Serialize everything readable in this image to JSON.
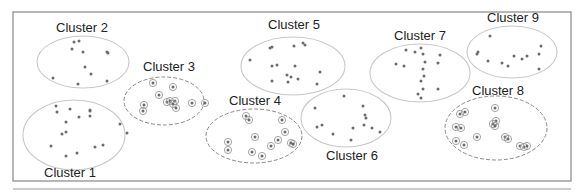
{
  "diagram": {
    "title": "",
    "frame": {
      "x": 13,
      "y": 12,
      "w": 558,
      "h": 169,
      "stroke": "#888888"
    },
    "lower_frame": {
      "x": 13,
      "y": 189,
      "w": 558,
      "stroke": "#999999"
    },
    "colors": {
      "dot": "#6b6b6b",
      "solid_ellipse": "#c8c8c8",
      "dashed_ellipse": "#8a8a8a",
      "ring": "#9a9a9a",
      "label": "#222222"
    },
    "clusters": [
      {
        "id": 1,
        "label": "Cluster 1",
        "style": "solid",
        "cx": 74,
        "cy": 135,
        "rx": 51,
        "ry": 35,
        "label_x": 44,
        "label_y": 177,
        "points": [
          [
            56,
            106
          ],
          [
            70,
            109
          ],
          [
            90,
            110
          ],
          [
            57,
            112
          ],
          [
            90,
            111
          ],
          [
            79,
            117
          ],
          [
            90,
            116
          ],
          [
            66,
            122
          ],
          [
            120,
            124
          ],
          [
            127,
            133
          ],
          [
            62,
            134
          ],
          [
            66,
            132
          ],
          [
            51,
            146
          ],
          [
            95,
            147
          ],
          [
            103,
            145
          ],
          [
            66,
            156
          ],
          [
            77,
            153
          ]
        ]
      },
      {
        "id": 2,
        "label": "Cluster 2",
        "style": "solid",
        "cx": 83,
        "cy": 62,
        "rx": 46,
        "ry": 26,
        "label_x": 56,
        "label_y": 32,
        "points": [
          [
            74,
            42
          ],
          [
            79,
            41
          ],
          [
            72,
            49
          ],
          [
            83,
            52
          ],
          [
            107,
            52
          ],
          [
            108,
            53
          ],
          [
            85,
            67
          ],
          [
            91,
            74
          ],
          [
            53,
            78
          ],
          [
            78,
            84
          ],
          [
            107,
            81
          ]
        ]
      },
      {
        "id": 3,
        "label": "Cluster 3",
        "style": "dashed",
        "cx": 164,
        "cy": 101,
        "rx": 40,
        "ry": 24,
        "label_x": 143,
        "label_y": 71,
        "points": [
          [
            153,
            83
          ],
          [
            173,
            87
          ],
          [
            159,
            95
          ],
          [
            144,
            105
          ],
          [
            167,
            102
          ],
          [
            170,
            101
          ],
          [
            175,
            101
          ],
          [
            173,
            104
          ],
          [
            176,
            108
          ],
          [
            192,
            103
          ],
          [
            205,
            103
          ],
          [
            143,
            111
          ]
        ]
      },
      {
        "id": 4,
        "label": "Cluster 4",
        "style": "dashed",
        "cx": 254,
        "cy": 136,
        "rx": 48,
        "ry": 27,
        "label_x": 229,
        "label_y": 105,
        "points": [
          [
            246,
            116
          ],
          [
            249,
            120
          ],
          [
            282,
            120
          ],
          [
            285,
            132
          ],
          [
            255,
            137
          ],
          [
            278,
            140
          ],
          [
            228,
            142
          ],
          [
            271,
            146
          ],
          [
            291,
            143
          ],
          [
            293,
            144
          ],
          [
            228,
            150
          ],
          [
            252,
            152
          ],
          [
            262,
            156
          ]
        ]
      },
      {
        "id": 5,
        "label": "Cluster 5",
        "style": "solid",
        "cx": 293,
        "cy": 66,
        "rx": 52,
        "ry": 29,
        "label_x": 268,
        "label_y": 29,
        "points": [
          [
            270,
            48
          ],
          [
            272,
            47
          ],
          [
            294,
            46
          ],
          [
            303,
            43
          ],
          [
            305,
            45
          ],
          [
            250,
            60
          ],
          [
            272,
            66
          ],
          [
            277,
            65
          ],
          [
            295,
            66
          ],
          [
            320,
            72
          ],
          [
            287,
            75
          ],
          [
            291,
            77
          ],
          [
            298,
            79
          ],
          [
            272,
            81
          ],
          [
            288,
            82
          ],
          [
            317,
            84
          ]
        ]
      },
      {
        "id": 6,
        "label": "Cluster 6",
        "style": "solid",
        "cx": 346,
        "cy": 118,
        "rx": 45,
        "ry": 29,
        "label_x": 326,
        "label_y": 160,
        "points": [
          [
            344,
            96
          ],
          [
            315,
            108
          ],
          [
            363,
            106
          ],
          [
            365,
            115
          ],
          [
            366,
            118
          ],
          [
            322,
            125
          ],
          [
            317,
            127
          ],
          [
            353,
            128
          ],
          [
            364,
            125
          ],
          [
            372,
            128
          ],
          [
            380,
            132
          ],
          [
            333,
            134
          ],
          [
            351,
            140
          ]
        ]
      },
      {
        "id": 7,
        "label": "Cluster 7",
        "style": "solid",
        "cx": 420,
        "cy": 73,
        "rx": 50,
        "ry": 29,
        "label_x": 394,
        "label_y": 40,
        "points": [
          [
            406,
            50
          ],
          [
            415,
            52
          ],
          [
            421,
            48
          ],
          [
            423,
            54
          ],
          [
            440,
            55
          ],
          [
            396,
            64
          ],
          [
            404,
            66
          ],
          [
            425,
            62
          ],
          [
            438,
            63
          ],
          [
            423,
            69
          ],
          [
            424,
            76
          ],
          [
            421,
            81
          ],
          [
            423,
            89
          ],
          [
            438,
            89
          ],
          [
            418,
            94
          ],
          [
            421,
            98
          ]
        ]
      },
      {
        "id": 8,
        "label": "Cluster 8",
        "style": "dashed",
        "cx": 496,
        "cy": 128,
        "rx": 51,
        "ry": 32,
        "label_x": 472,
        "label_y": 95,
        "points": [
          [
            460,
            114
          ],
          [
            465,
            112
          ],
          [
            495,
            108
          ],
          [
            496,
            121
          ],
          [
            493,
            124
          ],
          [
            495,
            126
          ],
          [
            456,
            127
          ],
          [
            461,
            128
          ],
          [
            477,
            137
          ],
          [
            505,
            137
          ],
          [
            508,
            139
          ],
          [
            456,
            141
          ],
          [
            464,
            145
          ],
          [
            520,
            146
          ],
          [
            524,
            147
          ],
          [
            527,
            146
          ]
        ]
      },
      {
        "id": 9,
        "label": "Cluster 9",
        "style": "dashed_no",
        "cx": 512,
        "cy": 52,
        "rx": 45,
        "ry": 26,
        "label_x": 487,
        "label_y": 22,
        "points": [
          [
            490,
            36
          ],
          [
            478,
            52
          ],
          [
            477,
            54
          ],
          [
            488,
            61
          ],
          [
            502,
            63
          ],
          [
            508,
            66
          ],
          [
            514,
            56
          ],
          [
            522,
            59
          ],
          [
            527,
            56
          ],
          [
            541,
            46
          ],
          [
            539,
            54
          ],
          [
            539,
            69
          ]
        ]
      }
    ]
  }
}
